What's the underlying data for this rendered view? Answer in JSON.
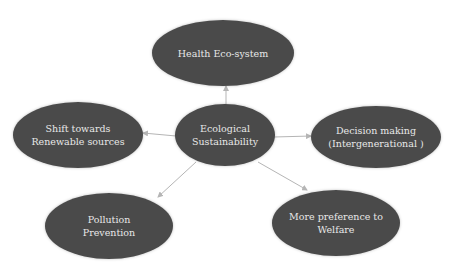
{
  "diagram": {
    "type": "hub-and-spoke",
    "center": {
      "label": "Ecological\nSustainability"
    },
    "nodes": [
      {
        "id": "top",
        "label": "Health Eco-system"
      },
      {
        "id": "left",
        "label": "Shift towards\nRenewable sources"
      },
      {
        "id": "right",
        "label": "Decision making\n(Intergenerational )"
      },
      {
        "id": "bottom-left",
        "label": "Pollution\nPrevention"
      },
      {
        "id": "bottom-right",
        "label": "More preference to\nWelfare"
      }
    ],
    "colors": {
      "node_fill": "#4a4a4a",
      "node_text": "#e8e8e8",
      "connector": "#b5b5b5"
    }
  }
}
